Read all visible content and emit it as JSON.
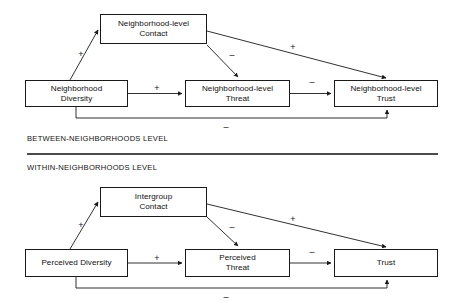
{
  "figure": {
    "line_color": "#1a1a1a",
    "divider_color": "#4b4b4b",
    "background": "#ffffff"
  },
  "panels": [
    {
      "id": "between",
      "caption": "BETWEEN-NEIGHBORHOODS LEVEL",
      "nodes": [
        {
          "id": "nl-contact",
          "label": "Neighborhood-level\nContact"
        },
        {
          "id": "nl-diversity",
          "label": "Neighborhood\nDiversity"
        },
        {
          "id": "nl-threat",
          "label": "Neighborhood-level\nThreat"
        },
        {
          "id": "nl-trust",
          "label": "Neighborhood-level\nTrust"
        }
      ],
      "paths": [
        {
          "id": "diversity-to-contact",
          "from": "nl-diversity",
          "to": "nl-contact",
          "sign": "+"
        },
        {
          "id": "diversity-to-threat",
          "from": "nl-diversity",
          "to": "nl-threat",
          "sign": "+"
        },
        {
          "id": "contact-to-threat",
          "from": "nl-contact",
          "to": "nl-threat",
          "sign": "–"
        },
        {
          "id": "contact-to-trust",
          "from": "nl-contact",
          "to": "nl-trust",
          "sign": "+"
        },
        {
          "id": "threat-to-trust",
          "from": "nl-threat",
          "to": "nl-trust",
          "sign": "–"
        },
        {
          "id": "diversity-to-trust",
          "from": "nl-diversity",
          "to": "nl-trust",
          "sign": "–"
        }
      ]
    },
    {
      "id": "within",
      "caption": "WITHIN-NEIGHBORHOODS LEVEL",
      "nodes": [
        {
          "id": "ig-contact",
          "label": "Intergroup\nContact"
        },
        {
          "id": "pc-diversity",
          "label": "Perceived Diversity"
        },
        {
          "id": "pc-threat",
          "label": "Perceived\nThreat"
        },
        {
          "id": "pc-trust",
          "label": "Trust"
        }
      ],
      "paths": [
        {
          "id": "pdiversity-to-contact",
          "from": "pc-diversity",
          "to": "ig-contact",
          "sign": "+"
        },
        {
          "id": "pdiversity-to-threat",
          "from": "pc-diversity",
          "to": "pc-threat",
          "sign": "+"
        },
        {
          "id": "pcontact-to-threat",
          "from": "ig-contact",
          "to": "pc-threat",
          "sign": "–"
        },
        {
          "id": "pcontact-to-trust",
          "from": "ig-contact",
          "to": "pc-trust",
          "sign": "+"
        },
        {
          "id": "pthreat-to-trust",
          "from": "pc-threat",
          "to": "pc-trust",
          "sign": "–"
        },
        {
          "id": "pdiversity-to-trust",
          "from": "pc-diversity",
          "to": "pc-trust",
          "sign": "–"
        }
      ]
    }
  ]
}
